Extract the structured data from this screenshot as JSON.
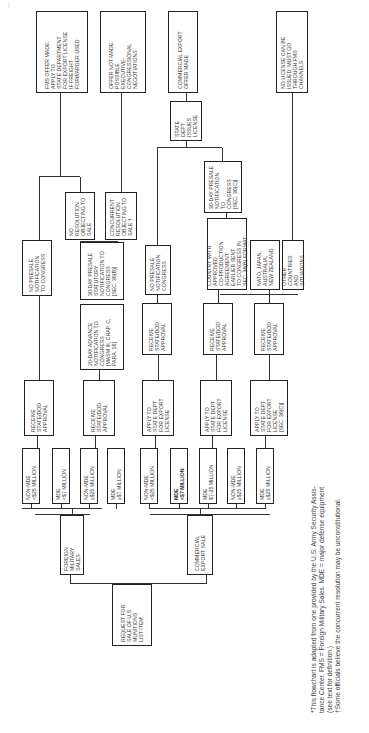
{
  "page": {
    "header_fragment": "…"
  },
  "start": {
    "label": "REQUEST FOR\nSALE OF U.S.\nMUNITIONS\nLIST ITEM"
  },
  "branches": {
    "fms": {
      "label": "FOREIGN\nMILITARY\nSALES"
    },
    "ces": {
      "label": "COMMERCIAL\nEXPORT SALE"
    }
  },
  "fms_values": [
    {
      "label": "NON-MDE\n<$25 MILLION"
    },
    {
      "label": "MDE\n<$7 MILLION"
    },
    {
      "label": "NON-MDE\n≥$25 MILLION"
    },
    {
      "label": "MDE\n≥$7 MILLION"
    }
  ],
  "ces_values": [
    {
      "label": "NON-MDE\n<$25 MILLION"
    },
    {
      "label": "MDE\n<$7 MILLION"
    },
    {
      "label": "MDE\n$7-25 MILLION"
    },
    {
      "label": "NON-MDE\n≥$25 MILLION"
    },
    {
      "label": "MDE\n≥$25 MILLION"
    }
  ],
  "fms_approvals": [
    {
      "label": "RECEIVE\nSTATE/DOD\nAPPROVAL"
    },
    {
      "label": "RECEIVE\nSTATE/DOD\nAPPROVAL"
    }
  ],
  "ces_apply": [
    {
      "label": "APPLY TO\nSTATE DEPT\nFOR EXPORT\nLICENSE"
    },
    {
      "label": "APPLY TO\nSTATE DEPT\nFOR EXPORT\nLICENSE"
    },
    {
      "label": "APPLY TO\nSTATE DEPT\nFOR EXPORT\nLICENSE\n[SEC. 36(c)]"
    }
  ],
  "fms_notify": [
    {
      "label": "NO PRESALE\nNOTIFICATION\nTO CONGRESS"
    },
    {
      "label": "20-DAY ADVANCE\nNOTIFICATION TO\nCONGRESS\n[MASM III, CHAP. C,\nPARA. 16]"
    },
    {
      "label": "30-DAY PRESALE\nSTATUTORY\nNOTIFICATION TO\nCONGRESS\n[SEC. 36(b)]"
    }
  ],
  "ces_approval": [
    {
      "label": "RECEIVE\nSTATE/DOD\nAPPROVAL"
    },
    {
      "label": "RECEIVE\nSTATE/DOD\nAPPROVAL"
    },
    {
      "label": "RECEIVE\nSTATE/DOD\nAPPROVAL"
    }
  ],
  "ces_notify": [
    {
      "label": "NO PRESALE\nNOTIFICATION\nCONGRESS"
    },
    {
      "label": "30-DAY PRESALE\nNOTIFICATION TO\nCONGRESS\n[SEC. 36(c)]"
    }
  ],
  "country": [
    {
      "label": "COUNTRY WITH\nAPPROVED\nCO-PRODUCTION\nAGREEMENT\nEARLIER SENT\nTO CONGRESS IN\nSEC. 36(b) FORMAT"
    },
    {
      "label": "NATO, JAPAN,\nAUSTRALIA,\nNEW ZEALAND"
    },
    {
      "label": "OTHER COUNTRIES\nAND SITUATIONS"
    }
  ],
  "resolutions": [
    {
      "label": "NO RESOLUTION\nOBJECTING TO\nSALE"
    },
    {
      "label": "CONCURRENT\nRESOLUTION\nOBJECTING TO\nSALE †"
    }
  ],
  "outcomes": {
    "fms_offer": {
      "label": "FMS OFFER MADE.\nAPPLY TO\nSTATE DEPARTMENT\nFOR EXPORT LICENSE\nIF FREIGHT\nFORWARDER USED"
    },
    "offer_not_made": {
      "label": "OFFER NOT MADE.\nPOSSIBLE\nEXECUTIVE-\nCONGRESSIONAL\nNEGOTIATIONS"
    },
    "state_issues": {
      "label": "STATE\nDEPT ISSUES\nLICENSE"
    },
    "ces_offer": {
      "label": "COMMERCIAL EXPORT\nOFFER MADE"
    },
    "no_license": {
      "label": "NO LICENSE CAN BE\nISSUED; MUST GO\nTHROUGH FMS\nCHANNELS"
    }
  },
  "footnotes": {
    "text": "*This flowchart is adapted from one provided by the U.S. Army Security Assis-\n  tance Center. FMS = Foreign Military Sales. MDE = major defense equipment\n  (see text for definition.)\n†Some officials believe the concurrent resolution may be unconstitutional."
  }
}
